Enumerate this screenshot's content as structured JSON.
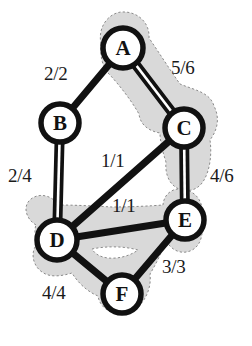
{
  "figure": {
    "type": "flow-network-graph",
    "background_color": "#ffffff",
    "node_fill": "#ffffff",
    "node_stroke": "#111111",
    "edge_color": "#111111",
    "shade_fill": "#d9d9d9",
    "shade_stroke": "#8a8a8a"
  },
  "nodes": [
    {
      "id": "A",
      "label": "A",
      "x": 123,
      "y": 48,
      "r": 20
    },
    {
      "id": "B",
      "label": "B",
      "x": 60,
      "y": 123,
      "r": 19
    },
    {
      "id": "C",
      "label": "C",
      "x": 184,
      "y": 128,
      "r": 19
    },
    {
      "id": "D",
      "label": "D",
      "x": 57,
      "y": 240,
      "r": 20
    },
    {
      "id": "E",
      "label": "E",
      "x": 185,
      "y": 220,
      "r": 19
    },
    {
      "id": "F",
      "label": "F",
      "x": 122,
      "y": 294,
      "r": 19
    }
  ],
  "edges": [
    {
      "id": "ab",
      "from": "A",
      "to": "B",
      "label": "2/2",
      "flow": 2,
      "capacity": 2,
      "style": "single",
      "label_x": 44,
      "label_y": 64
    },
    {
      "id": "ac",
      "from": "A",
      "to": "C",
      "label": "5/6",
      "flow": 5,
      "capacity": 6,
      "style": "double",
      "label_x": 171,
      "label_y": 58
    },
    {
      "id": "bd",
      "from": "B",
      "to": "D",
      "label": "2/4",
      "flow": 2,
      "capacity": 4,
      "style": "double",
      "label_x": 8,
      "label_y": 166
    },
    {
      "id": "cd",
      "from": "C",
      "to": "D",
      "label": "1/1",
      "flow": 1,
      "capacity": 1,
      "style": "single",
      "label_x": 101,
      "label_y": 151
    },
    {
      "id": "ce",
      "from": "C",
      "to": "E",
      "label": "4/6",
      "flow": 4,
      "capacity": 6,
      "style": "double",
      "label_x": 210,
      "label_y": 166
    },
    {
      "id": "de",
      "from": "D",
      "to": "E",
      "label": "1/1",
      "flow": 1,
      "capacity": 1,
      "style": "single",
      "label_x": 112,
      "label_y": 196
    },
    {
      "id": "ef",
      "from": "E",
      "to": "F",
      "label": "3/3",
      "flow": 3,
      "capacity": 3,
      "style": "single",
      "label_x": 162,
      "label_y": 257
    },
    {
      "id": "df",
      "from": "D",
      "to": "F",
      "label": "4/4",
      "flow": 4,
      "capacity": 4,
      "style": "single",
      "label_x": 42,
      "label_y": 283
    }
  ],
  "shaded_regions": [
    {
      "id": "upper-cut-region",
      "name": "region-around-A-C",
      "covers": [
        "A",
        "C"
      ]
    },
    {
      "id": "lower-cut-region",
      "name": "region-around-D-E-F",
      "covers": [
        "D",
        "E",
        "F"
      ]
    }
  ]
}
